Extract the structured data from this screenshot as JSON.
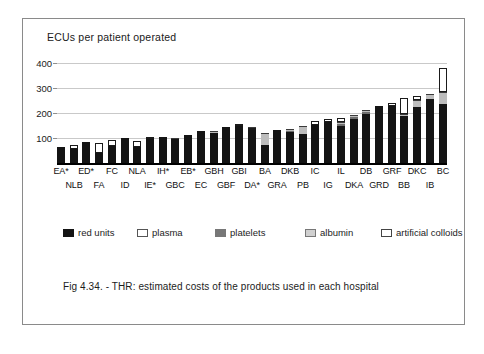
{
  "figure": {
    "caption": "Fig 4.34. - THR: estimated costs of the products used in  each hospital"
  },
  "legend": {
    "items": [
      {
        "label": "red units",
        "key": "red",
        "color": "#141414"
      },
      {
        "label": "plasma",
        "key": "plasma",
        "color": "#ffffff"
      },
      {
        "label": "platelets",
        "key": "platelets",
        "color": "#6e6e6e"
      },
      {
        "label": "albumin",
        "key": "albumin",
        "color": "#bdbdbd"
      },
      {
        "label": "artificial colloids",
        "key": "colloids",
        "color": "#ffffff"
      }
    ]
  },
  "chart_data": {
    "type": "bar",
    "stacked": true,
    "title": "ECUs  per  patient operated",
    "xlabel": "",
    "ylabel": "",
    "ylim": [
      0,
      400
    ],
    "yticks": [
      100,
      200,
      300,
      400
    ],
    "grid": true,
    "legend_position": "below-plot",
    "categories": [
      "EA*",
      "NLB",
      "ED*",
      "FA",
      "FC",
      "ID",
      "NLA",
      "IE*",
      "IH*",
      "GBC",
      "EB*",
      "EC",
      "GBH",
      "GBF",
      "GBI",
      "DA*",
      "BA",
      "GRA",
      "DKB",
      "PB",
      "IC",
      "IG",
      "IL",
      "DKA",
      "DB",
      "GRD",
      "GRF",
      "BB",
      "DKC",
      "IB",
      "BC"
    ],
    "series": [
      {
        "name": "red units",
        "values": [
          63,
          58,
          86,
          42,
          68,
          99,
          64,
          96,
          104,
          97,
          113,
          127,
          119,
          143,
          147,
          132,
          74,
          131,
          125,
          118,
          151,
          163,
          150,
          178,
          198,
          228,
          228,
          188,
          225,
          255,
          235
        ]
      },
      {
        "name": "plasma",
        "values": [
          0,
          13,
          0,
          40,
          25,
          0,
          26,
          4,
          0,
          0,
          0,
          0,
          0,
          0,
          0,
          6,
          0,
          0,
          0,
          0,
          0,
          0,
          0,
          0,
          0,
          0,
          0,
          0,
          0,
          0,
          0
        ]
      },
      {
        "name": "platelets",
        "values": [
          0,
          0,
          0,
          0,
          0,
          0,
          0,
          0,
          0,
          0,
          0,
          0,
          0,
          0,
          0,
          0,
          0,
          0,
          4,
          0,
          0,
          0,
          5,
          6,
          5,
          0,
          0,
          0,
          0,
          0,
          0
        ]
      },
      {
        "name": "albumin",
        "values": [
          0,
          0,
          0,
          0,
          0,
          0,
          0,
          0,
          0,
          5,
          0,
          0,
          9,
          0,
          0,
          6,
          47,
          0,
          7,
          30,
          0,
          0,
          10,
          9,
          8,
          0,
          0,
          9,
          27,
          20,
          48
        ]
      },
      {
        "name": "artificial colloids",
        "values": [
          0,
          0,
          0,
          0,
          0,
          0,
          0,
          0,
          0,
          0,
          0,
          0,
          0,
          0,
          6,
          0,
          0,
          0,
          0,
          0,
          16,
          14,
          14,
          0,
          0,
          0,
          11,
          63,
          17,
          0,
          98
        ]
      }
    ]
  }
}
